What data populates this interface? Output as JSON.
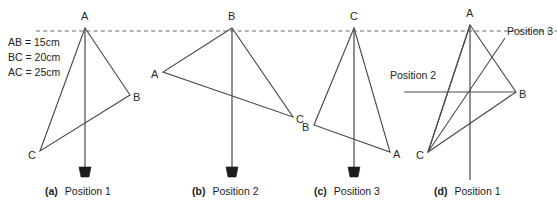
{
  "figure": {
    "width": 557,
    "height": 208,
    "background": "#ffffff",
    "line_color": "#4c4c4c",
    "datum_color": "#6b6b6b",
    "bob_color": "#1c1c1c"
  },
  "legend": {
    "lines": [
      "AB = 15cm",
      "BC = 20cm",
      "AC = 25cm"
    ]
  },
  "datum_line": {
    "label": "horizontal-datum-dashed-line",
    "y": 31
  },
  "panels": [
    {
      "tag": "(a)",
      "caption": "Position 1",
      "apex": "A",
      "vertices": [
        {
          "name": "A",
          "x": 85,
          "y": 28,
          "label_x": 81,
          "label_y": 11
        },
        {
          "name": "B",
          "x": 130,
          "y": 95,
          "label_x": 133,
          "label_y": 92
        },
        {
          "name": "C",
          "x": 40,
          "y": 151,
          "label_x": 28,
          "label_y": 150
        }
      ],
      "plumb": {
        "x": 85,
        "y_top": 28,
        "y_bottom": 167
      },
      "has_bob": true
    },
    {
      "tag": "(b)",
      "caption": "Position 2",
      "apex": "B",
      "vertices": [
        {
          "name": "B",
          "x": 232,
          "y": 28,
          "label_x": 228,
          "label_y": 11
        },
        {
          "name": "A",
          "x": 163,
          "y": 72,
          "label_x": 151,
          "label_y": 69
        },
        {
          "name": "C",
          "x": 293,
          "y": 117,
          "label_x": 296,
          "label_y": 114
        }
      ],
      "plumb": {
        "x": 232,
        "y_top": 28,
        "y_bottom": 167
      },
      "has_bob": true
    },
    {
      "tag": "(c)",
      "caption": "Position 3",
      "apex": "C",
      "vertices": [
        {
          "name": "C",
          "x": 354,
          "y": 28,
          "label_x": 350,
          "label_y": 11
        },
        {
          "name": "B",
          "x": 314,
          "y": 125,
          "label_x": 302,
          "label_y": 122
        },
        {
          "name": "A",
          "x": 390,
          "y": 152,
          "label_x": 393,
          "label_y": 149
        }
      ],
      "plumb": {
        "x": 354,
        "y_top": 28,
        "y_bottom": 167
      },
      "has_bob": true
    },
    {
      "tag": "(d)",
      "caption": "Position 1",
      "apex": "A",
      "vertices": [
        {
          "name": "A",
          "x": 470,
          "y": 25,
          "label_x": 466,
          "label_y": 8
        },
        {
          "name": "B",
          "x": 516,
          "y": 92,
          "label_x": 519,
          "label_y": 89
        },
        {
          "name": "C",
          "x": 428,
          "y": 152,
          "label_x": 416,
          "label_y": 150
        }
      ],
      "plumb": {
        "x": 470,
        "y_top": 25,
        "y_bottom": 180
      },
      "has_bob": false,
      "overlay_annotations": [
        {
          "text": "Position 2",
          "label_x": 390,
          "label_y": 70,
          "leader": "M 404 92 L 516 92"
        },
        {
          "text": "Position 3",
          "label_x": 507,
          "label_y": 26,
          "leader": "M 505 38 L 428 152"
        }
      ],
      "overlay_edges": [
        "M 470 25 L 428 152",
        "M 428 152 L 516 92",
        "M 470 25 L 516 92"
      ]
    }
  ]
}
